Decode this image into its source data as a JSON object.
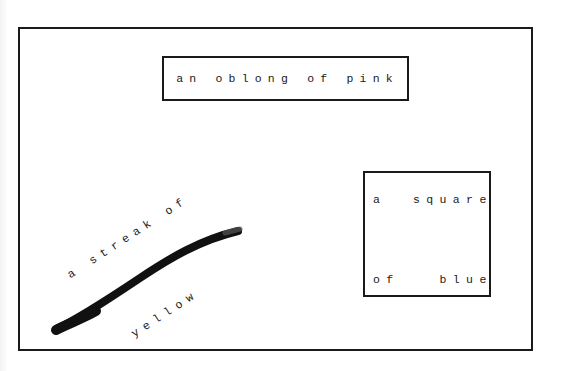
{
  "poem": {
    "oblong": {
      "text": "an oblong of pink",
      "color_named": "pink"
    },
    "square": {
      "line1": "a  square",
      "line2": "of   blue",
      "color_named": "blue"
    },
    "streak": {
      "line1": "a streak of",
      "line2": "yellow",
      "color_named": "yellow"
    }
  },
  "colors": {
    "ink": "#1a1a1a",
    "paper": "#ffffff"
  }
}
